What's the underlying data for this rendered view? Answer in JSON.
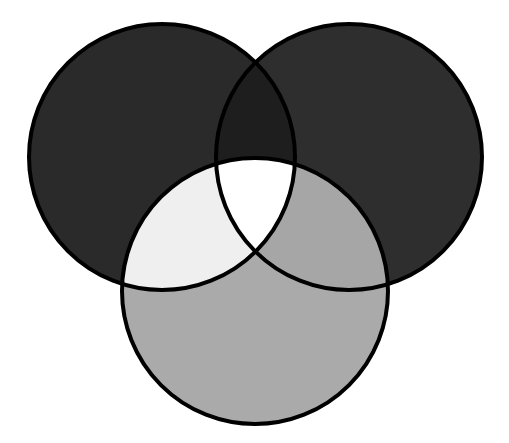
{
  "diagram": {
    "type": "venn",
    "set_count": 3,
    "stroke_color": "#000000",
    "stroke_width": 4,
    "background": "#ffffff",
    "sets": [
      {
        "id": "left",
        "cx": 162,
        "cy": 157,
        "r": 133
      },
      {
        "id": "right",
        "cx": 349,
        "cy": 157,
        "r": 133
      },
      {
        "id": "bottom",
        "cx": 255,
        "cy": 291,
        "r": 133
      }
    ],
    "regions": {
      "left_only": "#2a2a2a",
      "right_only": "#2e2e2e",
      "bottom_only": "#aaaaaa",
      "left_right": "#1e1e1e",
      "left_bottom": "#efefef",
      "right_bottom": "#a6a6a6",
      "left_right_bottom": "#ffffff"
    }
  }
}
